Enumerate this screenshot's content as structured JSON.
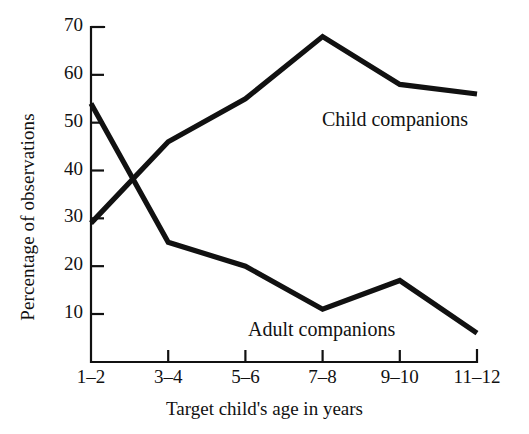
{
  "chart_data": {
    "type": "line",
    "title": "",
    "xlabel": "Target child's age in years",
    "ylabel": "Percentage of observations",
    "categories": [
      "1–2",
      "3–4",
      "5–6",
      "7–8",
      "9–10",
      "11–12"
    ],
    "ylim": [
      0,
      70
    ],
    "yticks": [
      10,
      20,
      30,
      40,
      50,
      60,
      70
    ],
    "ytick_labels": [
      "10",
      "20",
      "30",
      "40",
      "50",
      "60",
      "70"
    ],
    "grid": false,
    "legend_position": "inline-annotation",
    "series": [
      {
        "name": "Child companions",
        "values": [
          29,
          46,
          55,
          68,
          58,
          56
        ],
        "color": "#111111",
        "label_text": "Child companions"
      },
      {
        "name": "Adult companions",
        "values": [
          54,
          25,
          20,
          11,
          17,
          6
        ],
        "color": "#111111",
        "label_text": "Adult companions"
      }
    ],
    "annotations": [
      {
        "text": "Child companions",
        "x_px": 322,
        "y_px": 108
      },
      {
        "text": "Adult companions",
        "x_px": 248,
        "y_px": 318
      }
    ]
  },
  "axis": {
    "y_title": "Percentage of observations",
    "x_title": "Target child's age in years"
  }
}
